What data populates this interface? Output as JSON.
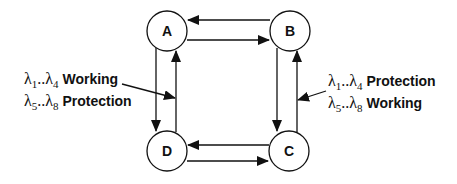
{
  "diagram": {
    "nodes": [
      {
        "id": "A",
        "label": "A",
        "cx": 167,
        "cy": 31
      },
      {
        "id": "B",
        "label": "B",
        "cx": 290,
        "cy": 31
      },
      {
        "id": "C",
        "label": "C",
        "cx": 289,
        "cy": 151
      },
      {
        "id": "D",
        "label": "D",
        "cx": 167,
        "cy": 151
      }
    ],
    "edges": [
      {
        "from": "B",
        "to": "A"
      },
      {
        "from": "A",
        "to": "B"
      },
      {
        "from": "A",
        "to": "D"
      },
      {
        "from": "D",
        "to": "A"
      },
      {
        "from": "B",
        "to": "C"
      },
      {
        "from": "C",
        "to": "B"
      },
      {
        "from": "C",
        "to": "D"
      },
      {
        "from": "D",
        "to": "C"
      }
    ],
    "left_annotation": {
      "line1": {
        "lambda_range": "λ1..λ4",
        "sym1": "λ",
        "sub1": "1",
        "dots": "..",
        "sym2": "λ",
        "sub2": "4",
        "role": "Working"
      },
      "line2": {
        "lambda_range": "λ5..λ8",
        "sym1": "λ",
        "sub1": "5",
        "dots": "..",
        "sym2": "λ",
        "sub2": "8",
        "role": "Protection"
      }
    },
    "right_annotation": {
      "line1": {
        "lambda_range": "λ1..λ4",
        "sym1": "λ",
        "sub1": "1",
        "dots": "..",
        "sym2": "λ",
        "sub2": "4",
        "role": "Protection"
      },
      "line2": {
        "lambda_range": "λ5..λ8",
        "sym1": "λ",
        "sub1": "5",
        "dots": "..",
        "sym2": "λ",
        "sub2": "8",
        "role": "Working"
      }
    }
  }
}
